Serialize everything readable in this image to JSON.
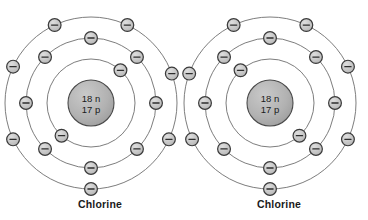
{
  "diagram": {
    "background_color": "#ffffff",
    "nucleus_fill": "#b0b0b0",
    "nucleus_stroke": "#4a4a4a",
    "electron_fill": "#c8c8c8",
    "electron_stroke": "#3a3a3a",
    "shell_stroke": "#6e6e6e",
    "text_color": "#1a1a1a"
  },
  "atoms": [
    {
      "id": "atom-left",
      "label": "Chlorine",
      "element_symbol": "Cl",
      "center": {
        "x": 91,
        "y": 103
      },
      "nucleus": {
        "radius": 23,
        "line1": "18 n",
        "line2": "17 p",
        "neutrons": 18,
        "protons": 17
      },
      "shells": [
        {
          "name": "inner-shell",
          "radius": 44,
          "electron_count": 2,
          "electron_angles": [
            -48,
            132
          ]
        },
        {
          "name": "middle-shell",
          "radius": 65,
          "electron_count": 8,
          "electron_angles": [
            -90,
            -45,
            0,
            45,
            90,
            135,
            180,
            225
          ]
        },
        {
          "name": "outer-shell",
          "radius": 86,
          "electron_count": 7,
          "electron_angles": [
            -115,
            -65,
            -20,
            25,
            90,
            155,
            205
          ]
        }
      ]
    },
    {
      "id": "atom-right",
      "label": "Chlorine",
      "element_symbol": "Cl",
      "center": {
        "x": 270,
        "y": 103
      },
      "nucleus": {
        "radius": 23,
        "line1": "18 n",
        "line2": "17 p",
        "neutrons": 18,
        "protons": 17
      },
      "shells": [
        {
          "name": "inner-shell",
          "radius": 44,
          "electron_count": 2,
          "electron_angles": [
            -132,
            48
          ]
        },
        {
          "name": "middle-shell",
          "radius": 65,
          "electron_count": 8,
          "electron_angles": [
            -90,
            -135,
            180,
            135,
            90,
            45,
            0,
            -45
          ]
        },
        {
          "name": "outer-shell",
          "radius": 86,
          "electron_count": 7,
          "electron_angles": [
            -65,
            -115,
            -160,
            155,
            90,
            25,
            -25
          ]
        }
      ]
    }
  ],
  "chart_data": {
    "type": "diagram",
    "items": [
      {
        "label": "Chlorine",
        "protons": 17,
        "neutrons": 18,
        "nucleus_text": [
          "18 n",
          "17 p"
        ],
        "shell_electron_counts": [
          2,
          8,
          7
        ],
        "total_electrons": 17
      },
      {
        "label": "Chlorine",
        "protons": 17,
        "neutrons": 18,
        "nucleus_text": [
          "18 n",
          "17 p"
        ],
        "shell_electron_counts": [
          2,
          8,
          7
        ],
        "total_electrons": 17
      }
    ],
    "electron_glyph": "−",
    "legend": []
  }
}
